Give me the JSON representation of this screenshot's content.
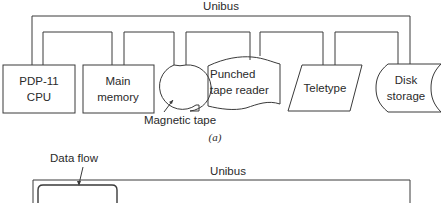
{
  "figure_a": {
    "bus_label": "Unibus",
    "caption": "(a)",
    "devices": [
      {
        "id": "cpu",
        "lines": [
          "PDP-11",
          "CPU"
        ],
        "shape": "rectangle"
      },
      {
        "id": "memory",
        "lines": [
          "Main",
          "memory"
        ],
        "shape": "rectangle"
      },
      {
        "id": "magtape",
        "lines": [],
        "shape": "tape-reel",
        "callout": "Magnetic tape"
      },
      {
        "id": "ptr",
        "lines": [
          "Punched",
          "tape reader"
        ],
        "shape": "punched-tape"
      },
      {
        "id": "teletype",
        "lines": [
          "Teletype"
        ],
        "shape": "parallelogram"
      },
      {
        "id": "disk",
        "lines": [
          "Disk",
          "storage"
        ],
        "shape": "disk-storage"
      }
    ]
  },
  "figure_b": {
    "callout": "Data flow",
    "bus_label": "Unibus"
  }
}
